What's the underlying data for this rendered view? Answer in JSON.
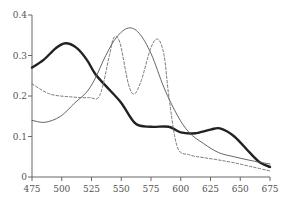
{
  "chart_data": {
    "type": "line",
    "title": "",
    "xlabel": "",
    "ylabel": "",
    "xlim": [
      475,
      675
    ],
    "ylim": [
      0,
      0.4
    ],
    "grid": false,
    "legend": null,
    "x_ticks": [
      475,
      500,
      525,
      550,
      575,
      600,
      625,
      650,
      675
    ],
    "x_tick_labels": [
      "475",
      "500",
      "525",
      "550",
      "575",
      "600",
      "625",
      "650",
      "675"
    ],
    "y_ticks": [
      0,
      0.1,
      0.2,
      0.3,
      0.4
    ],
    "y_tick_labels": [
      "0",
      "0.1",
      "0.2",
      "0.3",
      "0.4"
    ],
    "series": [
      {
        "name": "thick-solid",
        "style": "solid-thick",
        "color": "#222222",
        "x": [
          475,
          485,
          495,
          503,
          512,
          521,
          528,
          537,
          550,
          562,
          575,
          590,
          600,
          612,
          625,
          633,
          645,
          658,
          667,
          675
        ],
        "y": [
          0.27,
          0.29,
          0.318,
          0.33,
          0.32,
          0.29,
          0.255,
          0.225,
          0.183,
          0.132,
          0.124,
          0.124,
          0.11,
          0.108,
          0.117,
          0.12,
          0.1,
          0.06,
          0.035,
          0.025
        ]
      },
      {
        "name": "thin-solid",
        "style": "solid-thin",
        "color": "#555555",
        "x": [
          475,
          486,
          499,
          511,
          521,
          528,
          537,
          546,
          556,
          565,
          575,
          586,
          597,
          607,
          619,
          632,
          645,
          660,
          675
        ],
        "y": [
          0.14,
          0.135,
          0.15,
          0.183,
          0.21,
          0.243,
          0.3,
          0.345,
          0.368,
          0.355,
          0.305,
          0.22,
          0.153,
          0.11,
          0.083,
          0.06,
          0.05,
          0.04,
          0.032
        ]
      },
      {
        "name": "dashed",
        "style": "dashed",
        "color": "#777777",
        "x": [
          475,
          490,
          507,
          523,
          532,
          540,
          544,
          549,
          556,
          561,
          567,
          575,
          581,
          586,
          590,
          597,
          607,
          619,
          632,
          645,
          660,
          675
        ],
        "y": [
          0.23,
          0.205,
          0.198,
          0.196,
          0.202,
          0.3,
          0.345,
          0.33,
          0.23,
          0.205,
          0.24,
          0.32,
          0.34,
          0.3,
          0.2,
          0.075,
          0.055,
          0.048,
          0.042,
          0.035,
          0.025,
          0.015
        ]
      }
    ]
  }
}
